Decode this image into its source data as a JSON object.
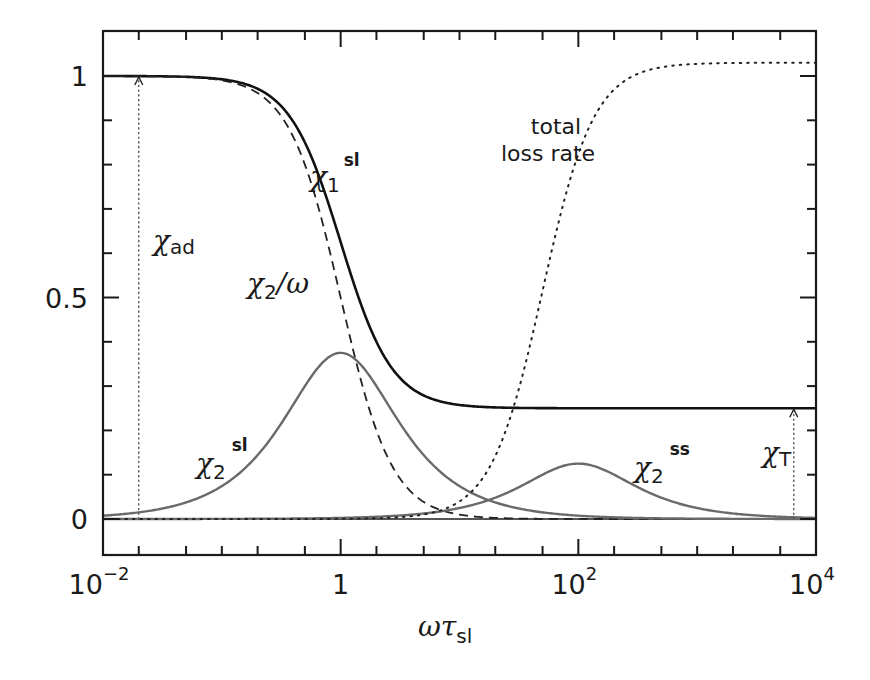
{
  "chart_data": {
    "type": "line",
    "title": "",
    "xlabel": "ωτ_sl",
    "xlabel_parts": {
      "main": "ωτ",
      "sub": "sl"
    },
    "ylabel": "",
    "xscale": "log",
    "xlim": [
      0.01,
      10000
    ],
    "ylim": [
      -0.07,
      1.1
    ],
    "grid": false,
    "legend": "none (inline curve labels)",
    "x_major_ticks": [
      {
        "value": 0.01,
        "base": "10",
        "exp": "−2"
      },
      {
        "value": 1,
        "base": "1",
        "exp": ""
      },
      {
        "value": 100,
        "base": "10",
        "exp": "2"
      },
      {
        "value": 10000,
        "base": "10",
        "exp": "4"
      }
    ],
    "y_major_ticks": [
      {
        "value": 0,
        "label": "0"
      },
      {
        "value": 0.5,
        "label": "0.5"
      },
      {
        "value": 1,
        "label": "1"
      }
    ],
    "y_minor_step": 0.1,
    "series": [
      {
        "name": "χ1^sl",
        "style": "solid-thick",
        "color": "#111111",
        "model": "chiT + (chiAd - chiT)/(1+x^2)",
        "params": {
          "chiAd": 1.0,
          "chiT": 0.25
        },
        "x": [
          0.01,
          0.1,
          0.3,
          1,
          3,
          10,
          100,
          10000
        ],
        "values": [
          1.0,
          0.993,
          0.938,
          0.625,
          0.325,
          0.257,
          0.25,
          0.25
        ]
      },
      {
        "name": "χ2/ω",
        "style": "dashed",
        "color": "#222222",
        "model": "chiAd/(1+x^2)",
        "params": {
          "chiAd": 1.0
        },
        "x": [
          0.01,
          0.1,
          0.3,
          1,
          3,
          10,
          100,
          10000
        ],
        "values": [
          1.0,
          0.99,
          0.917,
          0.5,
          0.1,
          0.0099,
          0.0001,
          0.0
        ]
      },
      {
        "name": "χ2^sl",
        "style": "solid-gray",
        "color": "#6a6a6a",
        "model": "A*x/(1+x^2)",
        "params": {
          "A": 0.75
        },
        "x": [
          0.01,
          0.1,
          0.3,
          1,
          3,
          10,
          100,
          10000
        ],
        "values": [
          0.0075,
          0.074,
          0.206,
          0.375,
          0.225,
          0.074,
          0.0075,
          0.0001
        ]
      },
      {
        "name": "χ2^ss",
        "style": "solid-gray",
        "color": "#6a6a6a",
        "model": "B*(x/x0)/(1+(x/x0)^2)",
        "params": {
          "B": 0.25,
          "x0": 100
        },
        "x": [
          0.01,
          1,
          10,
          30,
          100,
          300,
          1000,
          10000
        ],
        "values": [
          0.0,
          0.0025,
          0.025,
          0.069,
          0.125,
          0.075,
          0.025,
          0.0025
        ]
      },
      {
        "name": "total loss rate",
        "style": "dotted",
        "color": "#222222",
        "model": "L*x^2/(x^2+x0^2)",
        "params": {
          "L": 1.03,
          "x0": 50
        },
        "x": [
          0.01,
          1,
          10,
          30,
          50,
          100,
          300,
          1000,
          10000
        ],
        "values": [
          0.0,
          0.0004,
          0.04,
          0.273,
          0.515,
          0.824,
          1.002,
          1.027,
          1.03
        ]
      }
    ],
    "annotations": [
      {
        "id": "chi-ad",
        "text": "χad",
        "main": "χ",
        "sub": "ad",
        "type": "arrow",
        "x": 0.02,
        "from": 0,
        "to": 1.0,
        "style": "dotted-arrow"
      },
      {
        "id": "chi-t",
        "text": "χT",
        "main": "χ",
        "sub": "T",
        "type": "arrow",
        "x": 6500,
        "from": 0,
        "to": 0.25,
        "style": "dotted-arrow"
      },
      {
        "id": "label-chi1-sl",
        "main": "χ",
        "sub": "1",
        "sup": "sl"
      },
      {
        "id": "label-chi2-omega",
        "main": "χ",
        "sub": "2",
        "tail": "/ω"
      },
      {
        "id": "label-chi2-sl",
        "main": "χ",
        "sub": "2",
        "sup": "sl"
      },
      {
        "id": "label-chi2-ss",
        "main": "χ",
        "sub": "2",
        "sup": "ss"
      },
      {
        "id": "label-loss",
        "lines": [
          "total",
          "loss rate"
        ]
      }
    ]
  }
}
